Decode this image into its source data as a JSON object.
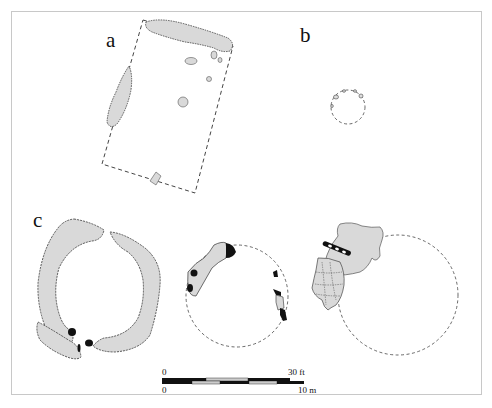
{
  "figure": {
    "panels": [
      {
        "id": "a",
        "label": "a"
      },
      {
        "id": "b",
        "label": "b"
      },
      {
        "id": "c",
        "label": "c"
      }
    ],
    "scale_bar": {
      "top_start": "0",
      "top_end": "30 ft",
      "bottom_start": "0",
      "bottom_end": "10 m"
    },
    "colors": {
      "feature_fill": "#d9d9d9",
      "feature_outline": "#333333",
      "dark_fill": "#111111",
      "frame": "#c8c8c8",
      "dashed_outline": "#444444"
    }
  }
}
